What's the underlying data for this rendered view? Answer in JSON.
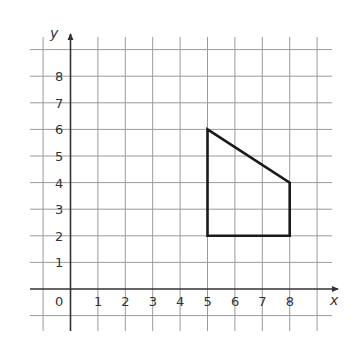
{
  "figure": {
    "type": "coordinate-grid-polygon",
    "axes": {
      "x_label": "x",
      "y_label": "y",
      "origin_label": "0",
      "x_ticks": [
        "1",
        "2",
        "3",
        "4",
        "5",
        "6",
        "7",
        "8"
      ],
      "y_ticks": [
        "1",
        "2",
        "3",
        "4",
        "5",
        "6",
        "7",
        "8"
      ],
      "x_range": [
        -1,
        9
      ],
      "y_range": [
        -1,
        9
      ]
    },
    "polygon": {
      "vertices": [
        [
          5,
          6
        ],
        [
          8,
          4
        ],
        [
          8,
          2
        ],
        [
          5,
          2
        ]
      ],
      "stroke_color": "#1a1a1a"
    },
    "colors": {
      "grid": "#9a9a9a",
      "axis": "#333333",
      "background": "#ffffff"
    }
  }
}
